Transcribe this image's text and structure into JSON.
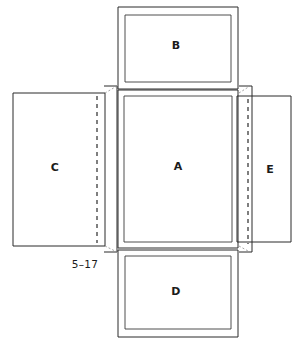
{
  "figure": {
    "number": "5–17",
    "type": "box-net-diagram",
    "background_color": "#ffffff",
    "line_color": "#2b2b2b",
    "text_color": "#1b1b1b"
  },
  "panels": [
    {
      "id": "B",
      "label": "B",
      "position": "top",
      "label_x": 176,
      "label_y": 46
    },
    {
      "id": "C",
      "label": "C",
      "position": "left",
      "label_x": 55,
      "label_y": 168
    },
    {
      "id": "A",
      "label": "A",
      "position": "center",
      "label_x": 178,
      "label_y": 167
    },
    {
      "id": "E",
      "label": "E",
      "position": "right",
      "label_x": 270,
      "label_y": 170
    },
    {
      "id": "D",
      "label": "D",
      "position": "bottom",
      "label_x": 176,
      "label_y": 292
    }
  ],
  "caption": {
    "text": "5–17",
    "x": 85,
    "y": 265
  }
}
